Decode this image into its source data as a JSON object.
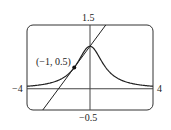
{
  "chart_data": {
    "type": "line",
    "title": "",
    "xlabel": "",
    "ylabel": "",
    "xlim": [
      -4,
      4
    ],
    "ylim": [
      -0.5,
      1.5
    ],
    "grid": false,
    "legend": "none",
    "tick_labels": {
      "x_min": "−4",
      "x_max": "4",
      "y_max": "1.5",
      "y_min": "−0.5"
    },
    "series": [
      {
        "name": "curve y = 1/(1+x^2)",
        "function": "1/(1+x^2)",
        "x": [
          -4,
          -3,
          -2,
          -1.5,
          -1,
          -0.5,
          0,
          0.5,
          1,
          1.5,
          2,
          3,
          4
        ],
        "y": [
          0.059,
          0.1,
          0.2,
          0.308,
          0.5,
          0.8,
          1.0,
          0.8,
          0.5,
          0.308,
          0.2,
          0.1,
          0.059
        ]
      },
      {
        "name": "tangent line y = 0.5x + 1",
        "function": "0.5*x+1",
        "x": [
          -3,
          1
        ],
        "y": [
          -0.5,
          1.5
        ]
      }
    ],
    "annotations": [
      {
        "text": "(−1, 0.5)",
        "x": -1,
        "y": 0.5,
        "marker": "point"
      }
    ]
  },
  "labels": {
    "y_max": "1.5",
    "y_min": "−0.5",
    "x_min": "−4",
    "x_max": "4",
    "point": "(−1, 0.5)"
  }
}
